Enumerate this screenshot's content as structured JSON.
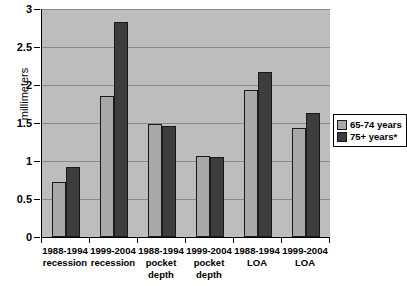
{
  "chart_data": {
    "type": "bar",
    "title": "",
    "xlabel": "",
    "ylabel": "millimeters",
    "ylim": [
      0,
      3
    ],
    "ytick_values": [
      0,
      0.5,
      1,
      1.5,
      2,
      2.5,
      3
    ],
    "ytick_labels": [
      "0",
      "0.5",
      "1",
      "1.5",
      "2",
      "2.5",
      "3"
    ],
    "grid": true,
    "legend_position": "right",
    "categories": [
      "1988-1994 recession",
      "1999-2004 recession",
      "1988-1994 pocket depth",
      "1999-2004 pocket depth",
      "1988-1994 LOA",
      "1999-2004 LOA"
    ],
    "category_lines": [
      [
        "1988-1994",
        "recession"
      ],
      [
        "1999-2004",
        "recession"
      ],
      [
        "1988-1994",
        "pocket",
        "depth"
      ],
      [
        "1999-2004",
        "pocket",
        "depth"
      ],
      [
        "1988-1994",
        "LOA"
      ],
      [
        "1999-2004",
        "LOA"
      ]
    ],
    "series": [
      {
        "name": "65-74 years",
        "color": "#a8a8a8",
        "values": [
          0.72,
          1.86,
          1.49,
          1.07,
          1.93,
          1.43
        ]
      },
      {
        "name": "75+ years*",
        "color": "#3d3d3d",
        "values": [
          0.92,
          2.83,
          1.46,
          1.05,
          2.17,
          1.63
        ]
      }
    ]
  },
  "legend": {
    "entries": [
      {
        "label": "65-74 years"
      },
      {
        "label": "75+ years*"
      }
    ]
  },
  "colors": {
    "plot_background": "#bdbdbd",
    "gridline": "#8a8a8a",
    "axis": "#000000",
    "series_a": "#a8a8a8",
    "series_b": "#3d3d3d"
  }
}
